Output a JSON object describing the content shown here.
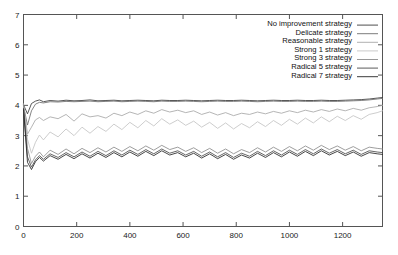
{
  "chart_data": {
    "type": "line",
    "title": "",
    "subtitle": "",
    "xlabel": "",
    "ylabel": "",
    "xlim": [
      0,
      1350
    ],
    "ylim": [
      0,
      7
    ],
    "grid": false,
    "legend_position": "top-right",
    "xticks": [
      0,
      200,
      400,
      600,
      800,
      1000,
      1200
    ],
    "xtick_labels": [
      "0",
      "200",
      "400",
      "600",
      "800",
      "1000",
      "1200"
    ],
    "yticks": [
      0,
      1,
      2,
      3,
      4,
      5,
      6,
      7
    ],
    "ytick_labels": [
      "0",
      "1",
      "2",
      "3",
      "4",
      "5",
      "6",
      "7"
    ],
    "x": [
      0,
      15,
      30,
      45,
      60,
      75,
      100,
      130,
      160,
      190,
      220,
      250,
      280,
      310,
      340,
      370,
      400,
      430,
      460,
      490,
      520,
      550,
      580,
      610,
      640,
      670,
      700,
      730,
      760,
      790,
      820,
      850,
      880,
      910,
      940,
      970,
      1000,
      1030,
      1060,
      1090,
      1120,
      1150,
      1180,
      1210,
      1240,
      1270,
      1300,
      1330,
      1350
    ],
    "series": [
      {
        "name": "No improvement strategy",
        "color": "#3a3a3a",
        "values": [
          4.02,
          3.72,
          4.06,
          4.14,
          4.18,
          4.12,
          4.16,
          4.14,
          4.17,
          4.15,
          4.16,
          4.18,
          4.15,
          4.16,
          4.17,
          4.15,
          4.16,
          4.17,
          4.16,
          4.15,
          4.17,
          4.16,
          4.16,
          4.17,
          4.16,
          4.15,
          4.16,
          4.17,
          4.16,
          4.16,
          4.17,
          4.16,
          4.15,
          4.16,
          4.17,
          4.16,
          4.16,
          4.17,
          4.16,
          4.16,
          4.17,
          4.16,
          4.16,
          4.17,
          4.18,
          4.19,
          4.21,
          4.24,
          4.26
        ]
      },
      {
        "name": "Delicate strategy",
        "color": "#6e6e6e",
        "values": [
          3.98,
          3.35,
          3.82,
          4.04,
          4.1,
          4.08,
          4.12,
          4.11,
          4.13,
          4.12,
          4.13,
          4.14,
          4.12,
          4.13,
          4.14,
          4.12,
          4.13,
          4.14,
          4.13,
          4.12,
          4.14,
          4.13,
          4.13,
          4.14,
          4.13,
          4.12,
          4.13,
          4.14,
          4.13,
          4.13,
          4.14,
          4.13,
          4.12,
          4.13,
          4.14,
          4.13,
          4.13,
          4.14,
          4.13,
          4.13,
          4.14,
          4.13,
          4.13,
          4.14,
          4.15,
          4.16,
          4.18,
          4.21,
          4.23
        ]
      },
      {
        "name": "Reasonable strategy",
        "color": "#a8a8a8",
        "values": [
          4.05,
          3.05,
          3.28,
          3.52,
          3.6,
          3.5,
          3.62,
          3.56,
          3.7,
          3.48,
          3.72,
          3.62,
          3.66,
          3.58,
          3.74,
          3.66,
          3.78,
          3.7,
          3.82,
          3.74,
          3.86,
          3.78,
          3.84,
          3.76,
          3.82,
          3.7,
          3.78,
          3.68,
          3.76,
          3.66,
          3.74,
          3.7,
          3.78,
          3.72,
          3.8,
          3.74,
          3.82,
          3.76,
          3.84,
          3.78,
          3.86,
          3.8,
          3.88,
          3.82,
          3.9,
          3.84,
          3.92,
          3.96,
          4.0
        ]
      },
      {
        "name": "Strong 1 strategy",
        "color": "#c4c4c4",
        "values": [
          3.96,
          2.88,
          2.42,
          2.78,
          3.02,
          2.86,
          3.12,
          2.96,
          3.22,
          3.0,
          3.28,
          3.08,
          3.3,
          3.14,
          3.38,
          3.2,
          3.44,
          3.26,
          3.5,
          3.32,
          3.56,
          3.38,
          3.52,
          3.34,
          3.48,
          3.28,
          3.44,
          3.24,
          3.42,
          3.22,
          3.4,
          3.26,
          3.46,
          3.3,
          3.5,
          3.34,
          3.54,
          3.38,
          3.58,
          3.42,
          3.62,
          3.46,
          3.64,
          3.5,
          3.66,
          3.54,
          3.7,
          3.76,
          3.82
        ]
      },
      {
        "name": "Strong 3 strategy",
        "color": "#8c8c8c",
        "values": [
          4.0,
          2.58,
          2.08,
          2.32,
          2.46,
          2.3,
          2.52,
          2.38,
          2.56,
          2.4,
          2.58,
          2.44,
          2.6,
          2.46,
          2.62,
          2.48,
          2.64,
          2.5,
          2.66,
          2.52,
          2.68,
          2.54,
          2.62,
          2.48,
          2.6,
          2.44,
          2.58,
          2.42,
          2.56,
          2.4,
          2.54,
          2.44,
          2.6,
          2.46,
          2.62,
          2.48,
          2.64,
          2.5,
          2.66,
          2.52,
          2.68,
          2.54,
          2.66,
          2.52,
          2.64,
          2.5,
          2.62,
          2.58,
          2.56
        ]
      },
      {
        "name": "Radical 5 strategy",
        "color": "#4a4a4a",
        "values": [
          3.9,
          2.3,
          1.96,
          2.2,
          2.34,
          2.22,
          2.4,
          2.28,
          2.44,
          2.3,
          2.46,
          2.32,
          2.48,
          2.34,
          2.5,
          2.36,
          2.52,
          2.38,
          2.54,
          2.4,
          2.56,
          2.42,
          2.5,
          2.36,
          2.48,
          2.32,
          2.46,
          2.3,
          2.44,
          2.28,
          2.42,
          2.32,
          2.48,
          2.34,
          2.5,
          2.36,
          2.52,
          2.38,
          2.54,
          2.4,
          2.56,
          2.42,
          2.54,
          2.4,
          2.52,
          2.38,
          2.5,
          2.46,
          2.44
        ]
      },
      {
        "name": "Radical 7 strategy",
        "color": "#262626",
        "values": [
          3.86,
          2.12,
          1.88,
          2.14,
          2.28,
          2.16,
          2.34,
          2.22,
          2.38,
          2.24,
          2.4,
          2.26,
          2.42,
          2.28,
          2.44,
          2.3,
          2.46,
          2.32,
          2.48,
          2.34,
          2.5,
          2.36,
          2.44,
          2.3,
          2.42,
          2.26,
          2.4,
          2.24,
          2.38,
          2.22,
          2.36,
          2.26,
          2.42,
          2.28,
          2.44,
          2.3,
          2.46,
          2.32,
          2.48,
          2.34,
          2.5,
          2.36,
          2.48,
          2.34,
          2.46,
          2.32,
          2.44,
          2.4,
          2.38
        ]
      }
    ]
  },
  "legend": {
    "entries": [
      "No improvement strategy",
      "Delicate strategy",
      "Reasonable strategy",
      "Strong 1 strategy",
      "Strong 3 strategy",
      "Radical 5 strategy",
      "Radical 7 strategy"
    ]
  }
}
